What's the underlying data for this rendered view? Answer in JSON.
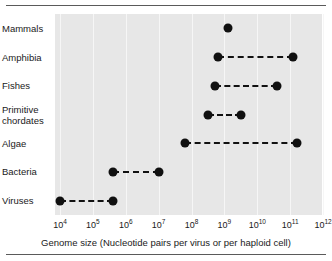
{
  "chart_data": {
    "type": "scatter",
    "title": "",
    "xlabel": "Genome size (Nucleotide pairs per virus or per haploid cell)",
    "ylabel": "",
    "xscale": "log",
    "xlim": [
      10000,
      1000000000000
    ],
    "grid": true,
    "legend": "none",
    "x_tick_labels": [
      {
        "mantissa": "10",
        "exponent": "4",
        "value": 10000
      },
      {
        "mantissa": "10",
        "exponent": "5",
        "value": 100000
      },
      {
        "mantissa": "10",
        "exponent": "6",
        "value": 1000000
      },
      {
        "mantissa": "10",
        "exponent": "7",
        "value": 10000000
      },
      {
        "mantissa": "10",
        "exponent": "8",
        "value": 100000000
      },
      {
        "mantissa": "10",
        "exponent": "9",
        "value": 1000000000
      },
      {
        "mantissa": "10",
        "exponent": "10",
        "value": 10000000000
      },
      {
        "mantissa": "10",
        "exponent": "11",
        "value": 100000000000
      },
      {
        "mantissa": "10",
        "exponent": "12",
        "value": 1000000000000
      }
    ],
    "categories": [
      "Mammals",
      "Amphibia",
      "Fishes",
      "Primitive chordates",
      "Algae",
      "Bacteria",
      "Viruses"
    ],
    "series": [
      {
        "name": "Genome size range",
        "marker": "filled-circle",
        "line": "dashed",
        "color": "#101010",
        "points": [
          {
            "category": "Mammals",
            "label_line1": "Mammals",
            "label_line2": "",
            "min_exp": 9.1,
            "max_exp": 9.1,
            "single_point": true
          },
          {
            "category": "Amphibia",
            "label_line1": "Amphibia",
            "label_line2": "",
            "min_exp": 8.8,
            "max_exp": 11.1,
            "single_point": false
          },
          {
            "category": "Fishes",
            "label_line1": "Fishes",
            "label_line2": "",
            "min_exp": 8.7,
            "max_exp": 10.6,
            "single_point": false
          },
          {
            "category": "Primitive chordates",
            "label_line1": "Primitive",
            "label_line2": "chordates",
            "min_exp": 8.5,
            "max_exp": 9.5,
            "single_point": false
          },
          {
            "category": "Algae",
            "label_line1": "Algae",
            "label_line2": "",
            "min_exp": 7.8,
            "max_exp": 11.2,
            "single_point": false
          },
          {
            "category": "Bacteria",
            "label_line1": "Bacteria",
            "label_line2": "",
            "min_exp": 5.6,
            "max_exp": 7.0,
            "single_point": false
          },
          {
            "category": "Viruses",
            "label_line1": "Viruses",
            "label_line2": "",
            "min_exp": 4.0,
            "max_exp": 5.6,
            "single_point": false
          }
        ]
      }
    ]
  },
  "colors": {
    "plot_background": "#e7e7e7",
    "gridline": "#f6f6f6",
    "marker": "#101010",
    "rule": "#5a5a5a",
    "text": "#1a1a1a"
  }
}
